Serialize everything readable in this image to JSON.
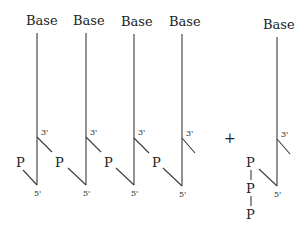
{
  "diagram": {
    "title": "",
    "nucleotides": [
      {
        "base_label": "Base",
        "three_prime": "3'",
        "five_prime": "5'",
        "phosphate": "P"
      },
      {
        "base_label": "Base",
        "three_prime": "3'",
        "five_prime": "5'",
        "phosphate": "P"
      },
      {
        "base_label": "Base",
        "three_prime": "3'",
        "five_prime": "5'",
        "phosphate": "P"
      },
      {
        "base_label": "Base",
        "three_prime": "3'",
        "five_prime": "5'",
        "phosphate": "P"
      }
    ],
    "operator": "+",
    "triphosphate_nucleotide": {
      "base_label": "Base",
      "three_prime": "3'",
      "five_prime": "5'",
      "phosphates": [
        "P",
        "P",
        "P"
      ]
    }
  }
}
